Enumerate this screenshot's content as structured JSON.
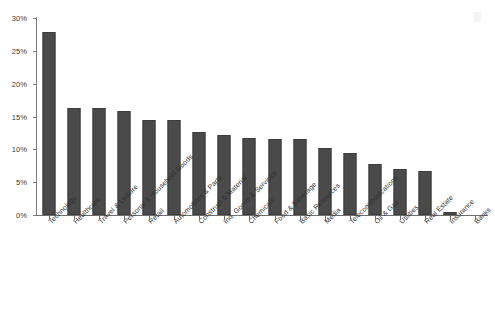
{
  "chart_data": {
    "type": "bar",
    "title": "",
    "subtitle": "",
    "xlabel": "",
    "ylabel": "",
    "ylim": [
      0,
      30
    ],
    "ytick_labels": [
      "0%",
      "5%",
      "10%",
      "15%",
      "20%",
      "25%",
      "30%"
    ],
    "ytick_values": [
      0,
      5,
      10,
      15,
      20,
      25,
      30
    ],
    "grid": false,
    "legend": false,
    "bar_color": "#4a4a4a",
    "categories": [
      "Technology",
      "Healthcare",
      "Travel & Leisure",
      "Personal & Household Goods",
      "Retail",
      "Automobiles & Parts",
      "Construct & Material",
      "Ind. Goods & Services",
      "Chemicals",
      "Food & Beverage",
      "Basic Resources",
      "Media",
      "Telecommunications",
      "Oil & Gas",
      "Utilities",
      "Real Estate",
      "Insurance",
      "Banks"
    ],
    "values": [
      27.9,
      16.3,
      16.3,
      15.8,
      14.5,
      14.4,
      12.6,
      12.2,
      11.8,
      11.6,
      11.5,
      10.2,
      9.4,
      7.8,
      7.0,
      6.7,
      0.5,
      0.0
    ]
  },
  "icons": {
    "scan_artifact": "scan-artifact-icon"
  }
}
